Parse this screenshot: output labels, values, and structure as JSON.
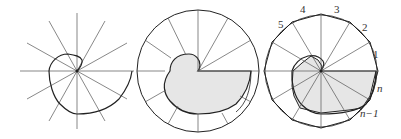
{
  "figure": {
    "panels": [
      {
        "id": "spiral-with-rays",
        "description": "Spiral curve crossed by 12 radial rays"
      },
      {
        "id": "spiral-in-circle",
        "description": "Shaded spiral region inside circle divided by radii"
      },
      {
        "id": "spiral-polygon-approx",
        "description": "Shaded polygonal approximation of spiral inside circumscribed polygon"
      }
    ],
    "labels": {
      "l1": "1",
      "l2": "2",
      "l3": "3",
      "l4": "4",
      "l5": "5",
      "ln": "n",
      "lnm1": "n−1"
    },
    "colors": {
      "line": "#222222",
      "thin_line": "#555555",
      "shade": "#e6e6e6"
    }
  }
}
